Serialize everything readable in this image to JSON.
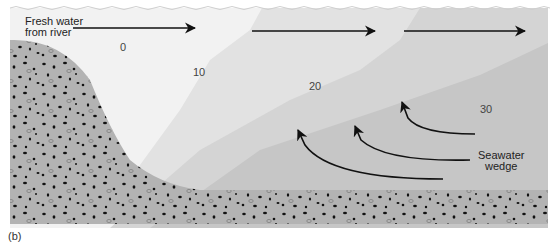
{
  "figure": {
    "panel_label": "(b)",
    "colors": {
      "fresh_water": "#f2f2f2",
      "layer_10": "#e2e2e2",
      "layer_20": "#d4d4d4",
      "layer_30": "#c6c6c6",
      "sediment": "#b3b3b3",
      "pebble": "#111111",
      "arrow": "#111111"
    },
    "labels": {
      "fresh_water_line1": "Fresh water",
      "fresh_water_line2": "from river",
      "seawater_line1": "Seawater",
      "seawater_line2": "wedge"
    },
    "salinity_isolines": [
      {
        "value": "0",
        "x": 120,
        "y": 48
      },
      {
        "value": "10",
        "x": 193,
        "y": 72
      },
      {
        "value": "20",
        "x": 309,
        "y": 86
      },
      {
        "value": "30",
        "x": 480,
        "y": 109
      }
    ],
    "surface_flow_arrows": 3,
    "wedge_flow_arrows": 3
  }
}
